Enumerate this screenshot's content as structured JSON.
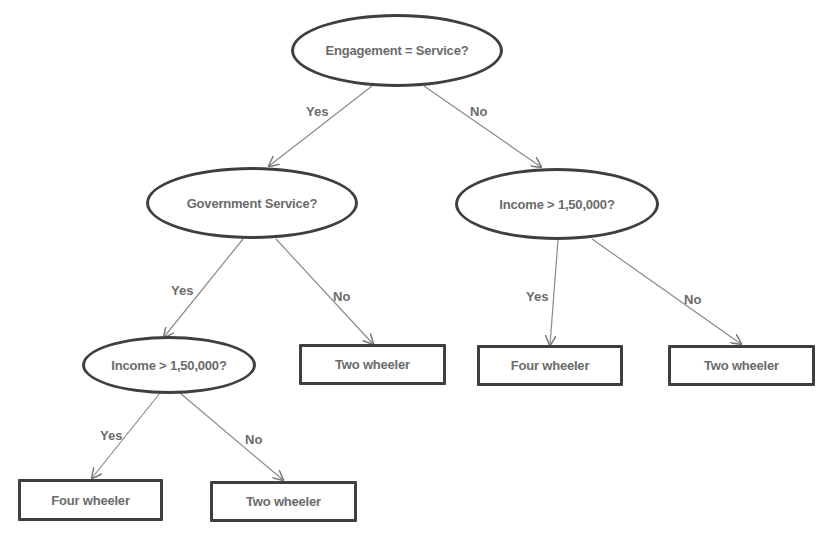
{
  "diagram": {
    "type": "decision-tree",
    "colors": {
      "node_border": "#3f3f3f",
      "text": "#6b6b6b",
      "edge": "#8a8a8a",
      "background": "#ffffff"
    },
    "nodes": {
      "root": {
        "shape": "ellipse",
        "label": "Engagement = Service?"
      },
      "gov": {
        "shape": "ellipse",
        "label": "Government Service?"
      },
      "income_right": {
        "shape": "ellipse",
        "label": "Income > 1,50,000?"
      },
      "income_left": {
        "shape": "ellipse",
        "label": "Income > 1,50,000?"
      },
      "leaf_gov_no": {
        "shape": "rectangle",
        "label": "Two wheeler"
      },
      "leaf_right_yes": {
        "shape": "rectangle",
        "label": "Four wheeler"
      },
      "leaf_right_no": {
        "shape": "rectangle",
        "label": "Two wheeler"
      },
      "leaf_left_yes": {
        "shape": "rectangle",
        "label": "Four wheeler"
      },
      "leaf_left_no": {
        "shape": "rectangle",
        "label": "Two wheeler"
      }
    },
    "edges": [
      {
        "from": "root",
        "to": "gov",
        "label": "Yes"
      },
      {
        "from": "root",
        "to": "income_right",
        "label": "No"
      },
      {
        "from": "gov",
        "to": "income_left",
        "label": "Yes"
      },
      {
        "from": "gov",
        "to": "leaf_gov_no",
        "label": "No"
      },
      {
        "from": "income_right",
        "to": "leaf_right_yes",
        "label": "Yes"
      },
      {
        "from": "income_right",
        "to": "leaf_right_no",
        "label": "No"
      },
      {
        "from": "income_left",
        "to": "leaf_left_yes",
        "label": "Yes"
      },
      {
        "from": "income_left",
        "to": "leaf_left_no",
        "label": "No"
      }
    ]
  }
}
